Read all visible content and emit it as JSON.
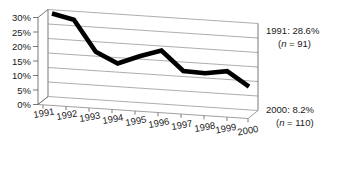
{
  "chart_data": {
    "type": "line",
    "title": "",
    "subtitle": "",
    "xlabel": "",
    "ylabel": "",
    "categories": [
      "1991",
      "1992",
      "1993",
      "1994",
      "1995",
      "1996",
      "1997",
      "1998",
      "1999",
      "2000"
    ],
    "series": [
      {
        "name": "",
        "values": [
          28.6,
          27.0,
          16.5,
          13.0,
          16.0,
          18.5,
          12.0,
          11.8,
          13.0,
          8.2
        ]
      }
    ],
    "ylim": [
      0,
      30
    ],
    "ytick_values": [
      0,
      5,
      10,
      15,
      20,
      25,
      30
    ],
    "ytick_labels": [
      "0%",
      "5%",
      "10%",
      "15%",
      "20%",
      "25%",
      "30%"
    ],
    "grid": true,
    "grid_axis": "y",
    "legend": false,
    "legend_position": "none",
    "three_d": true,
    "line_color": "#000000",
    "grid_color": "#8a8a8a",
    "background_color": "#ffffff",
    "annotations": [
      {
        "name": "first-point-annotation",
        "line1": "1991: 28.6%",
        "line2_prefix": "(",
        "line2_italic": "n",
        "line2_suffix": " = 91)",
        "line2": "(n = 91)",
        "target_category": "1991",
        "target_value": 28.6
      },
      {
        "name": "last-point-annotation",
        "line1": "2000: 8.2%",
        "line2_prefix": "(",
        "line2_italic": "n",
        "line2_suffix": " = 110)",
        "line2": "(n = 110)",
        "target_category": "2000",
        "target_value": 8.2
      }
    ]
  }
}
